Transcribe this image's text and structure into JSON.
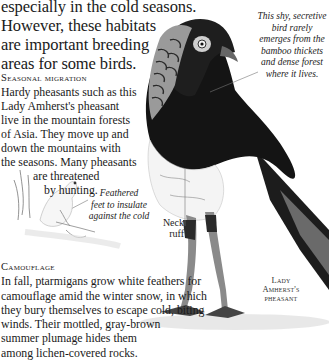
{
  "intro": {
    "lines": [
      "especially in the cold seasons.",
      "However, these habitats",
      "are important breeding",
      "areas for some birds."
    ]
  },
  "seasonal_migration": {
    "heading": "Seasonal migration",
    "lines": [
      "Hardy pheasants such as this",
      "Lady Amherst's pheasant",
      "live in the mountain forests",
      "of Asia. They move up and",
      "down the mountains with",
      "the seasons. Many pheasants",
      "are threatened",
      "by hunting."
    ]
  },
  "camouflage": {
    "heading": "Camouflage",
    "lines": [
      "In fall, ptarmigans grow white feathers for",
      "camouflage amid the winter snow, in which",
      "they bury themselves to escape cold, biting",
      "winds. Their mottled, gray-brown",
      "summer plumage hides them",
      "among lichen-covered rocks."
    ]
  },
  "captions": {
    "shy_bird": [
      "This shy, secretive",
      "bird rarely",
      "emerges from the",
      "bamboo thickets",
      "and dense forest",
      "where it lives."
    ],
    "feathered_feet": [
      "Feathered",
      "feet to insulate",
      "against the cold"
    ],
    "neck_ruff": [
      "Neck",
      "ruff"
    ],
    "species_label": [
      "Lady",
      "Amherst's",
      "pheasant"
    ]
  },
  "illustrations": {
    "main_bird": "lady-amherst-pheasant",
    "small_bird": "ptarmigan"
  }
}
